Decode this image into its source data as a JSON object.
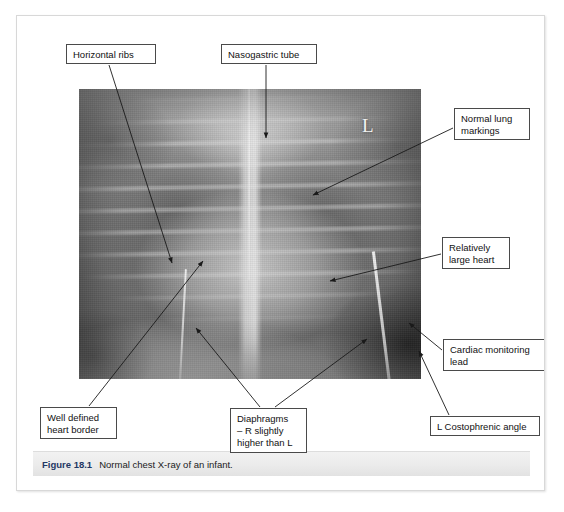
{
  "figure": {
    "caption_number": "Figure 18.1",
    "caption_text": "Normal chest X-ray of an infant.",
    "side_marker": "L",
    "image_alt": "chest-xray-infant"
  },
  "callouts": [
    {
      "name": "horizontal-ribs",
      "label": "Horizontal ribs",
      "box": {
        "x": 49,
        "y": 28,
        "w": 90,
        "h": 20
      },
      "arrows": [
        {
          "x1": 92,
          "y1": 49,
          "x2": 155,
          "y2": 247
        }
      ]
    },
    {
      "name": "nasogastric-tube",
      "label": "Nasogastric tube",
      "box": {
        "x": 204,
        "y": 28,
        "w": 96,
        "h": 20
      },
      "arrows": [
        {
          "x1": 249,
          "y1": 49,
          "x2": 249,
          "y2": 122
        }
      ]
    },
    {
      "name": "normal-lung-markings",
      "label": "Normal lung\nmarkings",
      "box": {
        "x": 437,
        "y": 92,
        "w": 76,
        "h": 32
      },
      "arrows": [
        {
          "x1": 436,
          "y1": 112,
          "x2": 296,
          "y2": 179
        }
      ]
    },
    {
      "name": "relatively-large-heart",
      "label": "Relatively\nlarge heart",
      "box": {
        "x": 425,
        "y": 221,
        "w": 68,
        "h": 32
      },
      "arrows": [
        {
          "x1": 424,
          "y1": 238,
          "x2": 313,
          "y2": 265
        }
      ]
    },
    {
      "name": "cardiac-monitoring-lead",
      "label": "Cardiac monitoring\nlead",
      "box": {
        "x": 426,
        "y": 323,
        "w": 102,
        "h": 32
      },
      "arrows": [
        {
          "x1": 425,
          "y1": 334,
          "x2": 392,
          "y2": 307
        }
      ]
    },
    {
      "name": "l-costophrenic-angle",
      "label": "L Costophrenic angle",
      "box": {
        "x": 413,
        "y": 400,
        "w": 110,
        "h": 20
      },
      "arrows": [
        {
          "x1": 432,
          "y1": 399,
          "x2": 402,
          "y2": 335
        }
      ]
    },
    {
      "name": "diaphragms",
      "label": "Diaphragms\n– R slightly\nhigher than L",
      "box": {
        "x": 213,
        "y": 392,
        "w": 77,
        "h": 45
      },
      "arrows": [
        {
          "x1": 243,
          "y1": 391,
          "x2": 179,
          "y2": 312
        },
        {
          "x1": 258,
          "y1": 391,
          "x2": 350,
          "y2": 323
        }
      ]
    },
    {
      "name": "well-defined-heart-border",
      "label": "Well defined\nheart border",
      "box": {
        "x": 23,
        "y": 391,
        "w": 77,
        "h": 32
      },
      "arrows": [
        {
          "x1": 72,
          "y1": 390,
          "x2": 186,
          "y2": 245
        }
      ]
    }
  ],
  "colors": {
    "callout_border": "#4a4a4a",
    "callout_background": "#ffffff",
    "arrow": "#1a1a1a",
    "caption_number": "#1f3864",
    "caption_band": "#ebebeb",
    "page_border": "#d8d8d8",
    "marker_text": "#f2f2f2"
  }
}
